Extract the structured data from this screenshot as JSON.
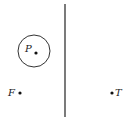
{
  "diagram": {
    "barrier": {
      "x": 65,
      "y1": 4,
      "y2": 117
    },
    "circle": {
      "cx": 34,
      "cy": 51,
      "r": 16
    },
    "points": [
      {
        "label": "P",
        "x": 36,
        "y": 53,
        "lx": 25,
        "ly": 52
      },
      {
        "label": "F",
        "x": 20,
        "y": 93,
        "lx": 8,
        "ly": 96
      },
      {
        "label": "T",
        "x": 112,
        "y": 93,
        "lx": 115,
        "ly": 96
      }
    ]
  },
  "labels": {
    "p": "P",
    "f": "F",
    "t": "T"
  },
  "colors": {
    "stroke": "#222222",
    "background": "#ffffff"
  }
}
